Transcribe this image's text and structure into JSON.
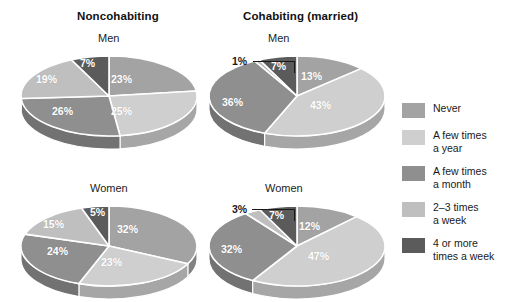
{
  "columns": [
    {
      "id": "noncohabiting",
      "title": "Noncohabiting"
    },
    {
      "id": "cohabiting",
      "title": "Cohabiting (married)"
    }
  ],
  "group_labels": {
    "men": "Men",
    "women": "Women"
  },
  "legend": {
    "items": [
      {
        "label": "Never",
        "color": "#a3a3a3"
      },
      {
        "label": "A few times\na year",
        "color": "#cfcfcf"
      },
      {
        "label": "A few times\na month",
        "color": "#8f8f8f"
      },
      {
        "label": "2–3 times\na week",
        "color": "#bfbfbf"
      },
      {
        "label": "4 or more\ntimes a week",
        "color": "#5b5b5b"
      }
    ]
  },
  "labels": {
    "nc_men": [
      "23%",
      "25%",
      "26%",
      "19%",
      "7%"
    ],
    "nc_women": [
      "32%",
      "23%",
      "24%",
      "15%",
      "5%"
    ],
    "co_men": [
      "13%",
      "43%",
      "36%",
      "1%",
      "7%"
    ],
    "co_women": [
      "12%",
      "47%",
      "32%",
      "3%",
      "7%"
    ]
  },
  "chart_data": {
    "type": "pie",
    "legend_position": "right",
    "categories": [
      "Never",
      "A few times a year",
      "A few times a month",
      "2–3 times a week",
      "4 or more times a week"
    ],
    "colors": [
      "#a3a3a3",
      "#cfcfcf",
      "#8f8f8f",
      "#bfbfbf",
      "#5b5b5b"
    ],
    "charts": [
      {
        "panel": "Noncohabiting",
        "group": "Men",
        "values": [
          23,
          25,
          26,
          19,
          7
        ],
        "labels": [
          "23%",
          "25%",
          "26%",
          "19%",
          "7%"
        ]
      },
      {
        "panel": "Noncohabiting",
        "group": "Women",
        "values": [
          32,
          23,
          24,
          15,
          5
        ],
        "labels": [
          "32%",
          "23%",
          "24%",
          "15%",
          "5%"
        ]
      },
      {
        "panel": "Cohabiting (married)",
        "group": "Men",
        "values": [
          13,
          43,
          36,
          1,
          7
        ],
        "labels": [
          "13%",
          "43%",
          "36%",
          "1%",
          "7%"
        ]
      },
      {
        "panel": "Cohabiting (married)",
        "group": "Women",
        "values": [
          12,
          47,
          32,
          3,
          7
        ],
        "labels": [
          "12%",
          "47%",
          "32%",
          "3%",
          "7%"
        ]
      }
    ]
  },
  "callouts": {
    "co_men_1pct": "1%",
    "co_women_3pct": "3%"
  }
}
